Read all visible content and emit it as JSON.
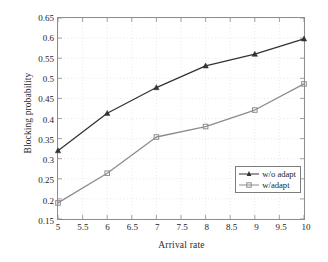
{
  "chart_data": {
    "type": "line",
    "title": "",
    "xlabel": "Arrival rate",
    "ylabel": "Blocking probability",
    "xlim": [
      5,
      10
    ],
    "ylim": [
      0.15,
      0.65
    ],
    "xticks": [
      "5",
      "5.5",
      "6",
      "6.5",
      "7",
      "7.5",
      "8",
      "8.5",
      "9",
      "9.5",
      "10"
    ],
    "xtick_values": [
      5,
      5.5,
      6,
      6.5,
      7,
      7.5,
      8,
      8.5,
      9,
      9.5,
      10
    ],
    "yticks": [
      "0.15",
      "0.2",
      "0.25",
      "0.3",
      "0.35",
      "0.4",
      "0.45",
      "0.5",
      "0.55",
      "0.6",
      "0.65"
    ],
    "ytick_values": [
      0.15,
      0.2,
      0.25,
      0.3,
      0.35,
      0.4,
      0.45,
      0.5,
      0.55,
      0.6,
      0.65
    ],
    "grid": true,
    "grid_style": "dotted",
    "legend_position": "lower right",
    "x": [
      5,
      6,
      7,
      8,
      9,
      10
    ],
    "series": [
      {
        "name": "w/o adapt",
        "color": "#333333",
        "marker": "triangle",
        "values": [
          0.32,
          0.413,
          0.477,
          0.531,
          0.56,
          0.598
        ]
      },
      {
        "name": "w/adapt",
        "color": "#8c8c8c",
        "marker": "square",
        "values": [
          0.19,
          0.264,
          0.354,
          0.38,
          0.421,
          0.486
        ]
      }
    ]
  },
  "legend": {
    "entries": [
      {
        "label": "w/o adapt"
      },
      {
        "label": "w/adapt"
      }
    ]
  },
  "colors": {
    "series_dark": "#333333",
    "series_light": "#8c8c8c",
    "axis": "#8a8a8a",
    "grid": "#c9c9c9",
    "text": "#232323"
  }
}
